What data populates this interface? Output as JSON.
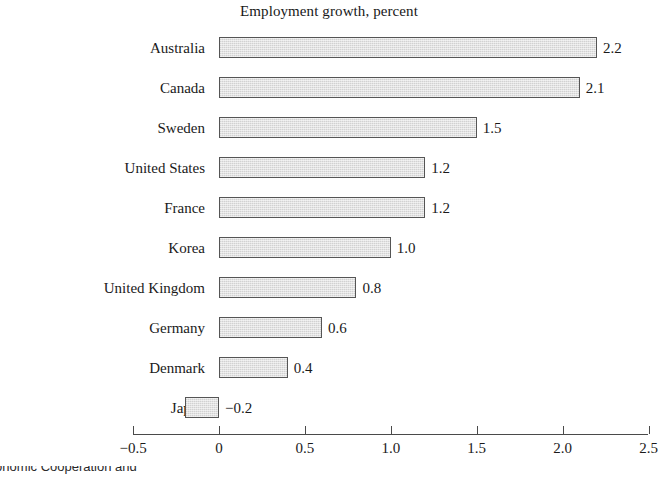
{
  "chart_data": {
    "type": "bar",
    "orientation": "horizontal",
    "title": "Employment growth, percent",
    "xlabel": "",
    "ylabel": "",
    "categories": [
      "Australia",
      "Canada",
      "Sweden",
      "United States",
      "France",
      "Korea",
      "United Kingdom",
      "Germany",
      "Denmark",
      "Japan"
    ],
    "values": [
      2.2,
      2.1,
      1.5,
      1.2,
      1.2,
      1.0,
      0.8,
      0.6,
      0.4,
      -0.2
    ],
    "value_labels": [
      "2.2",
      "2.1",
      "1.5",
      "1.2",
      "1.2",
      "1.0",
      "0.8",
      "0.6",
      "0.4",
      "−0.2"
    ],
    "xlim": [
      -0.5,
      2.5
    ],
    "xticks": [
      -0.5,
      0,
      0.5,
      1.0,
      1.5,
      2.0,
      2.5
    ],
    "xtick_labels": [
      "−0.5",
      "0",
      "0.5",
      "1.0",
      "1.5",
      "2.0",
      "2.5"
    ],
    "grid": false,
    "legend": null,
    "bar_fill_color": "#d9d9d9",
    "bar_edge_color": "#555555",
    "axis_color": "#4a4a4a",
    "text_color": "#1a1a1a"
  },
  "footnote": {
    "text": "r Economic Cooperation and"
  }
}
